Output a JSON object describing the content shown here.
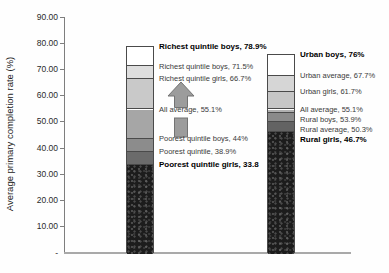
{
  "colors": {
    "background": "#fefefe",
    "axis_line": "#7e7e7e",
    "baseline": "#a9a9a9",
    "segment_border": "#4a4a4a",
    "arrow_fill": "#9c9c9c",
    "arrow_stroke": "#737373"
  },
  "icons": {
    "increase_arrow": "up-arrow"
  },
  "y_axis": {
    "title": "Average primary completion rate (%)",
    "ticks": [
      {
        "value": 90,
        "label": "90.00"
      },
      {
        "value": 80,
        "label": "80.00"
      },
      {
        "value": 70,
        "label": "70.00"
      },
      {
        "value": 60,
        "label": "60.00"
      },
      {
        "value": 50,
        "label": "50.00"
      },
      {
        "value": 40,
        "label": "40.00"
      },
      {
        "value": 30,
        "label": "30.00"
      },
      {
        "value": 20,
        "label": "20.00"
      },
      {
        "value": 10,
        "label": "10.00"
      },
      {
        "value": 0,
        "label": "-"
      }
    ]
  },
  "chart_data": {
    "type": "bar",
    "subtype": "stacked-threshold-columns",
    "title": "",
    "xlabel": "",
    "ylabel": "Average primary completion rate (%)",
    "ylim": [
      0,
      90
    ],
    "yticks": [
      0,
      10,
      20,
      30,
      40,
      50,
      60,
      70,
      80,
      90
    ],
    "grid": false,
    "legend": "none",
    "annotation": {
      "shape": "up-arrow",
      "direction": "up"
    },
    "bars": [
      {
        "id": "wealth-quintile-bar",
        "segments": [
          {
            "label": "Richest quintile boys, 78.9%",
            "value": 78.9,
            "bold": true,
            "color": "#ffffff"
          },
          {
            "label": "Richest quintile boys, 71.5%",
            "value": 71.5,
            "bold": false,
            "color": "#dedede"
          },
          {
            "label": "Richest quintile girls, 66.7%",
            "value": 66.7,
            "bold": false,
            "color": "#c9c9c9"
          },
          {
            "label": "All average, 55.1%",
            "value": 55.1,
            "bold": false,
            "color": "#a6a6a6"
          },
          {
            "label": "Poorest quintile boys, 44%",
            "value": 44,
            "bold": false,
            "color": "#8c8c8c"
          },
          {
            "label": "Poorest quintile, 38.9%",
            "value": 38.9,
            "bold": false,
            "color": "#6b6b6b"
          },
          {
            "label": "Poorest quintile girls, 33.8",
            "value": 33.8,
            "bold": true,
            "color": "#1c1c1c",
            "textured": true
          }
        ]
      },
      {
        "id": "urban-rural-bar",
        "segments": [
          {
            "label": "Urban boys, 76%",
            "value": 76,
            "bold": true,
            "color": "#ffffff"
          },
          {
            "label": "Urban average, 67.7%",
            "value": 67.7,
            "bold": false,
            "color": "#d6d6d6"
          },
          {
            "label": "Urban girls, 61.7%",
            "value": 61.7,
            "bold": false,
            "color": "#c6c6c6"
          },
          {
            "label": "All average, 55.1%",
            "value": 55.1,
            "bold": false,
            "color": "#b0b0b0"
          },
          {
            "label": "Rural boys, 53.9%",
            "value": 53.9,
            "bold": false,
            "color": "#8a8a8a"
          },
          {
            "label": "Rural average, 50.3%",
            "value": 50.3,
            "bold": false,
            "color": "#636363"
          },
          {
            "label": "Rural girls, 46.7%",
            "value": 46.7,
            "bold": true,
            "color": "#1c1c1c",
            "textured": true
          }
        ]
      }
    ]
  }
}
